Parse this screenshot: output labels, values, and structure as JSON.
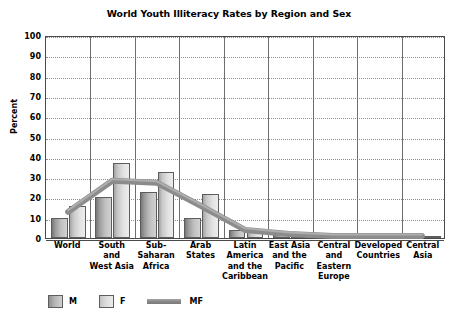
{
  "chart_data": {
    "type": "bar",
    "title": "World Youth Illiteracy Rates by Region and Sex",
    "xlabel": "",
    "ylabel": "Percent",
    "ylim": [
      0,
      100
    ],
    "ytick_step": 10,
    "yticks": [
      100,
      90,
      80,
      70,
      60,
      50,
      40,
      30,
      20,
      10,
      0
    ],
    "grid": true,
    "legend_position": "bottom-left",
    "categories": [
      "World",
      "South and West Asia",
      "Sub-Saharan Africa",
      "Arab States",
      "Latin America and the Caribbean",
      "East Asia and the Pacific",
      "Central and Eastern Europe",
      "Developed Countries",
      "Central Asia"
    ],
    "category_lines": [
      [
        "World"
      ],
      [
        "South",
        "and",
        "West Asia"
      ],
      [
        "Sub-",
        "Saharan",
        "Africa"
      ],
      [
        "Arab",
        "States"
      ],
      [
        "Latin",
        "America",
        "and the",
        "Caribbean"
      ],
      [
        "East Asia",
        "and the",
        "Pacific"
      ],
      [
        "Central",
        "and",
        "Eastern",
        "Europe"
      ],
      [
        "Developed",
        "Countries"
      ],
      [
        "Central",
        "Asia"
      ]
    ],
    "series": [
      {
        "name": "M",
        "type": "bar",
        "values": [
          10,
          20,
          22.5,
          10,
          4,
          1.5,
          1,
          1,
          1
        ]
      },
      {
        "name": "F",
        "type": "bar",
        "values": [
          16,
          37,
          32.5,
          21.5,
          4,
          2,
          1,
          1,
          0.8
        ]
      },
      {
        "name": "MF",
        "type": "line",
        "values": [
          13,
          28.5,
          27.5,
          16,
          4,
          2,
          1,
          1,
          1
        ]
      }
    ]
  },
  "legend": {
    "items": [
      {
        "label": "M",
        "marker": "swatch-dark-gray"
      },
      {
        "label": "F",
        "marker": "swatch-light-gray"
      },
      {
        "label": "MF",
        "marker": "thick-gray-line"
      }
    ]
  },
  "colors": {
    "bar_m": "#b0b0b0",
    "bar_f": "#dcdcdc",
    "line_mf": "#8a8a8a",
    "axis": "#4a4a4a",
    "grid": "#8d8d8d",
    "text": "#000000",
    "background": "#ffffff"
  }
}
